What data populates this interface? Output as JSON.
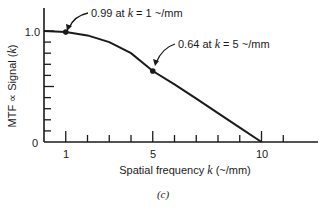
{
  "chart_data": {
    "type": "line",
    "title": "",
    "caption": "(c)",
    "xlabel": "Spatial frequency k (~/mm)",
    "xlabel_parts": {
      "pre": "Spatial frequency ",
      "var": "k",
      "post": " (~/mm)"
    },
    "ylabel": "MTF ∝ Signal (k)",
    "ylabel_parts": {
      "pre": "MTF ∝ Signal (",
      "var": "k",
      "post": ")"
    },
    "xlim": [
      0,
      12.5
    ],
    "ylim": [
      0,
      1.1
    ],
    "x_ticks": [
      1,
      2,
      3,
      4,
      5,
      6,
      7,
      8,
      9,
      10,
      11
    ],
    "x_tick_labels": {
      "1": "1",
      "5": "5",
      "10": "10"
    },
    "y_ticks": [
      0,
      0.1,
      0.2,
      0.3,
      0.4,
      0.5,
      0.6,
      0.7,
      0.8,
      0.9,
      1.0
    ],
    "y_tick_labels": {
      "0": "0",
      "1.0": "1.0"
    },
    "grid": false,
    "legend": null,
    "series": [
      {
        "name": "MTF",
        "x": [
          0,
          1,
          2,
          3,
          4,
          5,
          6,
          7,
          8,
          9,
          10
        ],
        "values": [
          1.0,
          0.99,
          0.96,
          0.9,
          0.8,
          0.64,
          0.52,
          0.39,
          0.26,
          0.13,
          0.0
        ]
      }
    ],
    "points": [
      {
        "x": 1,
        "y": 0.99
      },
      {
        "x": 5,
        "y": 0.64
      }
    ],
    "annotations": [
      {
        "text_pre": "0.99 at ",
        "var": "k",
        "text_post": " = 1 ~/mm",
        "x": 1,
        "y": 0.99
      },
      {
        "text_pre": "0.64 at ",
        "var": "k",
        "text_post": " = 5 ~/mm",
        "x": 5,
        "y": 0.64
      }
    ]
  }
}
